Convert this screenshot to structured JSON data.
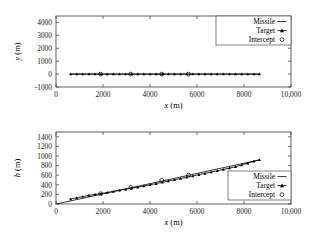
{
  "figure": {
    "background": "#ffffff",
    "ink": "#000000"
  },
  "chart_data": [
    {
      "id": "top",
      "type": "line",
      "title": "",
      "xlabel": "x (m)",
      "ylabel": "y (m)",
      "xlim": [
        0,
        10000
      ],
      "ylim": [
        -1000,
        4500
      ],
      "xticks": [
        0,
        2000,
        4000,
        6000,
        8000,
        10000
      ],
      "xticklabels": [
        "0",
        "2000",
        "4000",
        "6000",
        "8000",
        "10,000"
      ],
      "yticks": [
        -1000,
        0,
        1000,
        2000,
        3000,
        4000
      ],
      "yticklabels": [
        "-1000",
        "0",
        "1000",
        "2000",
        "3000",
        "4000"
      ],
      "grid": false,
      "legend_position": "upper right",
      "legend": [
        {
          "label": "Missile",
          "marker": "line"
        },
        {
          "label": "Target",
          "marker": "line-triangle"
        },
        {
          "label": "Intercept",
          "marker": "circle"
        }
      ],
      "series": [
        {
          "name": "Missile",
          "marker": "none",
          "x": [
            620,
            8660
          ],
          "y": [
            0,
            0
          ]
        },
        {
          "name": "Target",
          "marker": "triangle",
          "x": [
            620,
            880,
            1140,
            1400,
            1660,
            1920,
            2180,
            2440,
            2700,
            2960,
            3220,
            3480,
            3740,
            4000,
            4260,
            4520,
            4780,
            5040,
            5300,
            5560,
            5820,
            6080,
            6340,
            6600,
            6860,
            7120,
            7380,
            7640,
            7900,
            8160,
            8420,
            8660
          ],
          "y": [
            0,
            0,
            0,
            0,
            0,
            0,
            0,
            0,
            0,
            0,
            0,
            0,
            0,
            0,
            0,
            0,
            0,
            0,
            0,
            0,
            0,
            0,
            0,
            0,
            0,
            0,
            0,
            0,
            0,
            0,
            0,
            0
          ]
        },
        {
          "name": "Intercept",
          "marker": "circle",
          "x": [
            1900,
            3180,
            4500,
            5640
          ],
          "y": [
            0,
            0,
            0,
            0
          ]
        }
      ]
    },
    {
      "id": "bottom",
      "type": "line",
      "title": "",
      "xlabel": "x (m)",
      "ylabel": "h (m)",
      "xlim": [
        0,
        10000
      ],
      "ylim": [
        0,
        1500
      ],
      "xticks": [
        0,
        2000,
        4000,
        6000,
        8000,
        10000
      ],
      "xticklabels": [
        "0",
        "2000",
        "4000",
        "6000",
        "8000",
        "10,000"
      ],
      "yticks": [
        0,
        200,
        400,
        600,
        800,
        1000,
        1200,
        1400
      ],
      "yticklabels": [
        "0",
        "200",
        "400",
        "600",
        "800",
        "1000",
        "1200",
        "1400"
      ],
      "grid": false,
      "legend_position": "lower right",
      "legend": [
        {
          "label": "Missile",
          "marker": "line"
        },
        {
          "label": "Target",
          "marker": "line-triangle"
        },
        {
          "label": "Intercept",
          "marker": "circle"
        }
      ],
      "series": [
        {
          "name": "Missile",
          "marker": "none",
          "x": [
            60,
            8660
          ],
          "y": [
            5,
            920
          ]
        },
        {
          "name": "Target",
          "marker": "triangle",
          "x": [
            620,
            880,
            1140,
            1400,
            1660,
            1920,
            2180,
            2440,
            2700,
            2960,
            3220,
            3480,
            3740,
            4000,
            4260,
            4520,
            4780,
            5040,
            5300,
            5560,
            5820,
            6080,
            6340,
            6600,
            6860,
            7120,
            7380,
            7640,
            7900,
            8160,
            8420,
            8660
          ],
          "y": [
            105,
            130,
            155,
            180,
            200,
            218,
            240,
            262,
            285,
            308,
            330,
            352,
            375,
            400,
            425,
            452,
            478,
            505,
            530,
            558,
            585,
            612,
            638,
            665,
            692,
            720,
            748,
            778,
            812,
            852,
            890,
            920
          ]
        },
        {
          "name": "Intercept",
          "marker": "circle",
          "x": [
            1900,
            3180,
            4500,
            5640
          ],
          "y": [
            215,
            345,
            498,
            600
          ]
        }
      ]
    }
  ]
}
